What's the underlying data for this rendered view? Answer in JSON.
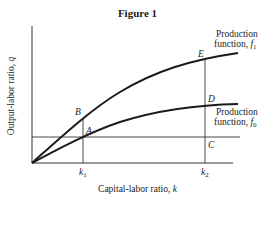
{
  "figure": {
    "title": "Figure 1",
    "x_axis_label": "Capital-labor ratio, ",
    "x_axis_var": "k",
    "y_axis_label": "Output-labor ratio, ",
    "y_axis_var": "q"
  },
  "curves": [
    {
      "name": "Production function, f1",
      "label_line1": "Production",
      "label_line2": "function, ",
      "func": "f",
      "sub": "1"
    },
    {
      "name": "Production function, f0",
      "label_line1": "Production",
      "label_line2": "function, ",
      "func": "f",
      "sub": "0"
    }
  ],
  "points": {
    "A": "A",
    "B": "B",
    "C": "C",
    "D": "D",
    "E": "E"
  },
  "ticks": [
    {
      "var": "k",
      "sub": "1"
    },
    {
      "var": "k",
      "sub": "2"
    }
  ],
  "colors": {
    "line": "#1a1a1a",
    "thin_line": "#333333",
    "background": "#ffffff"
  }
}
